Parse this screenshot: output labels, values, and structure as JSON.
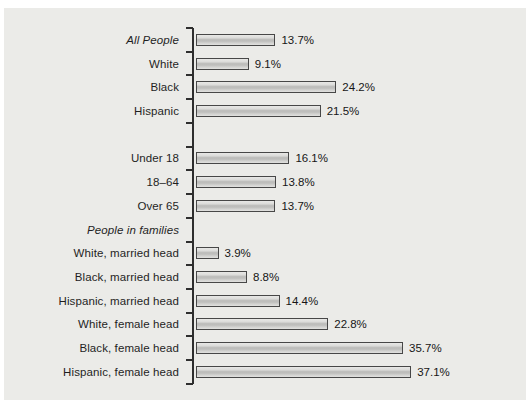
{
  "figure": {
    "panel_background": "#ebebe8",
    "page_background": "#ffffff",
    "bar_fill": "#cfcfcd",
    "bar_border": "#474747",
    "axis_color": "#2e2e2e",
    "text_color": "#1f1f1f"
  },
  "chart_data": {
    "type": "bar",
    "orientation": "horizontal",
    "title": "",
    "xlabel": "",
    "ylabel": "",
    "xlim": [
      0,
      40
    ],
    "value_unit": "%",
    "legend": null,
    "grid": false,
    "rows": [
      {
        "label": "All People",
        "value": 13.7,
        "display": "13.7%",
        "italic": true
      },
      {
        "label": "White",
        "value": 9.1,
        "display": "9.1%",
        "italic": false
      },
      {
        "label": "Black",
        "value": 24.2,
        "display": "24.2%",
        "italic": false
      },
      {
        "label": "Hispanic",
        "value": 21.5,
        "display": "21.5%",
        "italic": false
      },
      {
        "label": "",
        "value": null,
        "display": "",
        "italic": false,
        "spacer": true
      },
      {
        "label": "Under 18",
        "value": 16.1,
        "display": "16.1%",
        "italic": false
      },
      {
        "label": "18–64",
        "value": 13.8,
        "display": "13.8%",
        "italic": false
      },
      {
        "label": "Over 65",
        "value": 13.7,
        "display": "13.7%",
        "italic": false
      },
      {
        "label": "People in families",
        "value": null,
        "display": "",
        "italic": true,
        "section_header": true
      },
      {
        "label": "White, married head",
        "value": 3.9,
        "display": "3.9%",
        "italic": false
      },
      {
        "label": "Black, married head",
        "value": 8.8,
        "display": "8.8%",
        "italic": false
      },
      {
        "label": "Hispanic, married head",
        "value": 14.4,
        "display": "14.4%",
        "italic": false
      },
      {
        "label": "White, female head",
        "value": 22.8,
        "display": "22.8%",
        "italic": false
      },
      {
        "label": "Black, female head",
        "value": 35.7,
        "display": "35.7%",
        "italic": false
      },
      {
        "label": "Hispanic, female head",
        "value": 37.1,
        "display": "37.1%",
        "italic": false
      }
    ]
  }
}
